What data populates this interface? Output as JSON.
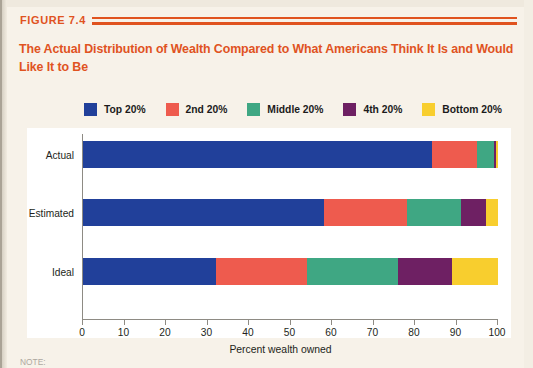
{
  "figure": {
    "label": "FIGURE 7.4",
    "title": "The Actual Distribution of Wealth Compared to What Americans Think It Is and Would Like It to Be",
    "note": "NOTE:",
    "accent_color": "#e0531f",
    "page_background": "#f7f2e9",
    "plot_background": "#ffffff"
  },
  "chart_data": {
    "type": "bar",
    "orientation": "horizontal",
    "stacked": true,
    "title": "The Actual Distribution of Wealth Compared to What Americans Think It Is and Would Like It to Be",
    "xlabel": "Percent wealth owned",
    "ylabel": "",
    "xlim": [
      0,
      100
    ],
    "xticks": [
      0,
      10,
      20,
      30,
      40,
      50,
      60,
      70,
      80,
      90,
      100
    ],
    "xtick_labels": [
      "0",
      "10",
      "20",
      "30",
      "40",
      "50",
      "60",
      "70",
      "80",
      "90",
      "100"
    ],
    "grid": false,
    "legend_position": "top",
    "categories": [
      "Actual",
      "Estimated",
      "Ideal"
    ],
    "series": [
      {
        "name": "Top 20%",
        "color": "#21409a",
        "values": [
          84.0,
          58.0,
          32.0
        ]
      },
      {
        "name": "2nd 20%",
        "color": "#ee5b4e",
        "values": [
          11.0,
          20.0,
          22.0
        ]
      },
      {
        "name": "Middle 20%",
        "color": "#3fa783",
        "values": [
          4.0,
          13.0,
          22.0
        ]
      },
      {
        "name": "4th 20%",
        "color": "#6e2063",
        "values": [
          0.5,
          6.0,
          13.0
        ]
      },
      {
        "name": "Bottom 20%",
        "color": "#f8ce2e",
        "values": [
          0.5,
          3.0,
          11.0
        ]
      }
    ],
    "cumulative_boundaries": {
      "Actual": [
        84.0,
        95.0,
        99.0,
        99.5,
        100.0
      ],
      "Estimated": [
        58.0,
        78.0,
        91.0,
        97.0,
        100.0
      ],
      "Ideal": [
        32.0,
        54.0,
        76.0,
        89.0,
        100.0
      ]
    }
  }
}
